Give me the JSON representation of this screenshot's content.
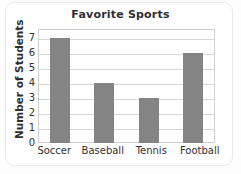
{
  "chart_data": {
    "type": "bar",
    "title": "Favorite Sports",
    "xlabel": "",
    "ylabel": "Number of Students",
    "categories": [
      "Soccer",
      "Baseball",
      "Tennis",
      "Football"
    ],
    "values": [
      7,
      4,
      3,
      6
    ],
    "ylim": [
      0,
      7.6
    ],
    "yticks": [
      0,
      1,
      2,
      3,
      4,
      5,
      6,
      7
    ],
    "ytick_labels": [
      "0",
      "1",
      "2",
      "3",
      "4",
      "5",
      "6",
      "7"
    ],
    "grid": true,
    "legend": "none",
    "colors": {
      "bar": "#848484",
      "gridline": "#d8d8d8",
      "plot_border": "#cfcfcf",
      "text": "#2f2f2f",
      "background": "#ffffff"
    }
  }
}
